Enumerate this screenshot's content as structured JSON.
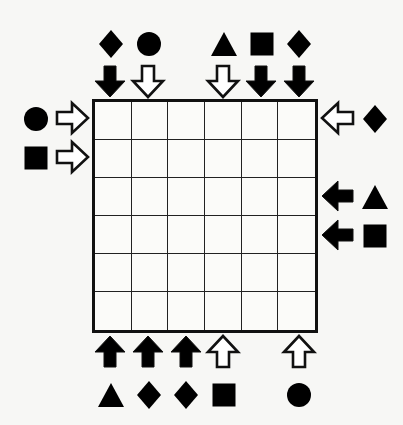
{
  "puzzle": {
    "title": "Arrow and Shape Logic Grid",
    "background_color": "#f7f7f5",
    "line_color": "#111111",
    "fill_color": "#000000",
    "grid": {
      "columns": 6,
      "rows": 6,
      "left": 92,
      "top": 99,
      "width": 226,
      "height": 234,
      "cell_size": 37.6,
      "cells": [
        [
          "",
          "",
          "",
          "",
          "",
          ""
        ],
        [
          "",
          "",
          "",
          "",
          "",
          ""
        ],
        [
          "",
          "",
          "",
          "",
          "",
          ""
        ],
        [
          "",
          "",
          "",
          "",
          "",
          ""
        ],
        [
          "",
          "",
          "",
          "",
          "",
          ""
        ],
        [
          "",
          "",
          "",
          "",
          "",
          ""
        ]
      ]
    },
    "top_clues": [
      {
        "column": 1,
        "shape": "diamond",
        "arrow": "down",
        "arrow_style": "filled"
      },
      {
        "column": 2,
        "shape": "circle",
        "arrow": "down",
        "arrow_style": "hollow"
      },
      {
        "column": 3,
        "shape": "none",
        "arrow": "none",
        "arrow_style": "none"
      },
      {
        "column": 4,
        "shape": "triangle",
        "arrow": "down",
        "arrow_style": "hollow"
      },
      {
        "column": 5,
        "shape": "square",
        "arrow": "down",
        "arrow_style": "filled"
      },
      {
        "column": 6,
        "shape": "diamond",
        "arrow": "down",
        "arrow_style": "filled"
      }
    ],
    "bottom_clues": [
      {
        "column": 1,
        "shape": "triangle",
        "arrow": "up",
        "arrow_style": "filled"
      },
      {
        "column": 2,
        "shape": "diamond",
        "arrow": "up",
        "arrow_style": "filled"
      },
      {
        "column": 3,
        "shape": "diamond",
        "arrow": "up",
        "arrow_style": "filled"
      },
      {
        "column": 4,
        "shape": "square",
        "arrow": "up",
        "arrow_style": "hollow"
      },
      {
        "column": 5,
        "shape": "none",
        "arrow": "none",
        "arrow_style": "none"
      },
      {
        "column": 6,
        "shape": "circle",
        "arrow": "up",
        "arrow_style": "hollow"
      }
    ],
    "left_clues": [
      {
        "row": 1,
        "shape": "circle",
        "arrow": "right",
        "arrow_style": "hollow"
      },
      {
        "row": 2,
        "shape": "square",
        "arrow": "right",
        "arrow_style": "hollow"
      },
      {
        "row": 3,
        "shape": "none",
        "arrow": "none",
        "arrow_style": "none"
      },
      {
        "row": 4,
        "shape": "none",
        "arrow": "none",
        "arrow_style": "none"
      },
      {
        "row": 5,
        "shape": "none",
        "arrow": "none",
        "arrow_style": "none"
      },
      {
        "row": 6,
        "shape": "none",
        "arrow": "none",
        "arrow_style": "none"
      }
    ],
    "right_clues": [
      {
        "row": 1,
        "shape": "diamond",
        "arrow": "left",
        "arrow_style": "hollow"
      },
      {
        "row": 2,
        "shape": "none",
        "arrow": "none",
        "arrow_style": "none"
      },
      {
        "row": 3,
        "shape": "triangle",
        "arrow": "left",
        "arrow_style": "filled"
      },
      {
        "row": 4,
        "shape": "square",
        "arrow": "left",
        "arrow_style": "filled"
      },
      {
        "row": 5,
        "shape": "none",
        "arrow": "none",
        "arrow_style": "none"
      },
      {
        "row": 6,
        "shape": "none",
        "arrow": "none",
        "arrow_style": "none"
      }
    ]
  }
}
